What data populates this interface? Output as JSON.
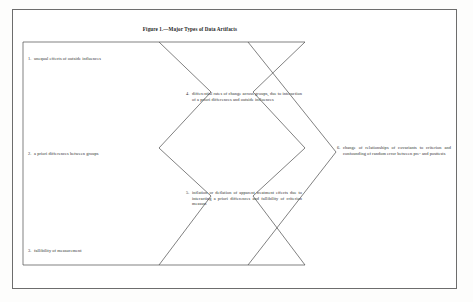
{
  "figure": {
    "caption": "Figure 1.—Major Types of Data Artifacts",
    "border_color": "#6d6d6d",
    "line_color": "#4a4a4a",
    "text_color": "#2e2e2e",
    "page_background": "#fdfdfc"
  },
  "items": [
    {
      "id": "item-1",
      "number": "1.",
      "text": "unequal effects of outside influences",
      "column": "left"
    },
    {
      "id": "item-2",
      "number": "2.",
      "text": "a priori differences between groups",
      "column": "left"
    },
    {
      "id": "item-3",
      "number": "3.",
      "text": "fallibility of measurement",
      "column": "left"
    },
    {
      "id": "item-4",
      "number": "4.",
      "text": "differential rates of change across groups, due to interaction of a priori differences and outside influences",
      "column": "middle"
    },
    {
      "id": "item-5",
      "number": "5.",
      "text": "inflation or deflation of apparent treatment effects due to interacting a priori differences and fallibility of criterion measure",
      "column": "middle"
    },
    {
      "id": "item-6",
      "number": "6.",
      "text": "change of relationships of covariants to criterion and confounding of random error between pre- and posttests",
      "column": "right"
    }
  ],
  "shapes": {
    "left_block_label": "left-source-block",
    "middle_chevron_label": "middle-chevron-block",
    "right_chevron_label": "right-chevron-block"
  }
}
